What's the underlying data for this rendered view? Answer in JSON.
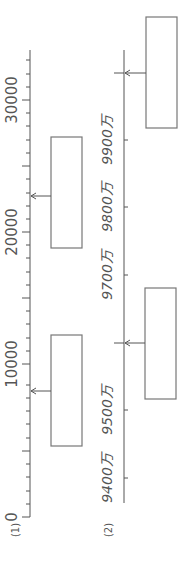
{
  "problems": [
    {
      "label": "(1)",
      "axis": {
        "min": 0,
        "max": 30000,
        "major_step": 10000,
        "minor_step": 1000
      },
      "tick_labels": [
        "0",
        "10000",
        "20000",
        "30000"
      ],
      "answer_boxes": [
        {
          "points_to": 23000,
          "value": ""
        },
        {
          "points_to": 8000,
          "value": ""
        }
      ]
    },
    {
      "label": "(2)",
      "tick_labels": [
        "9400万",
        "9500万",
        "9700万",
        "9800万",
        "9900万"
      ],
      "answer_boxes": [
        {
          "points_to": "9930万",
          "value": ""
        },
        {
          "points_to": "9600万",
          "value": ""
        }
      ]
    }
  ]
}
